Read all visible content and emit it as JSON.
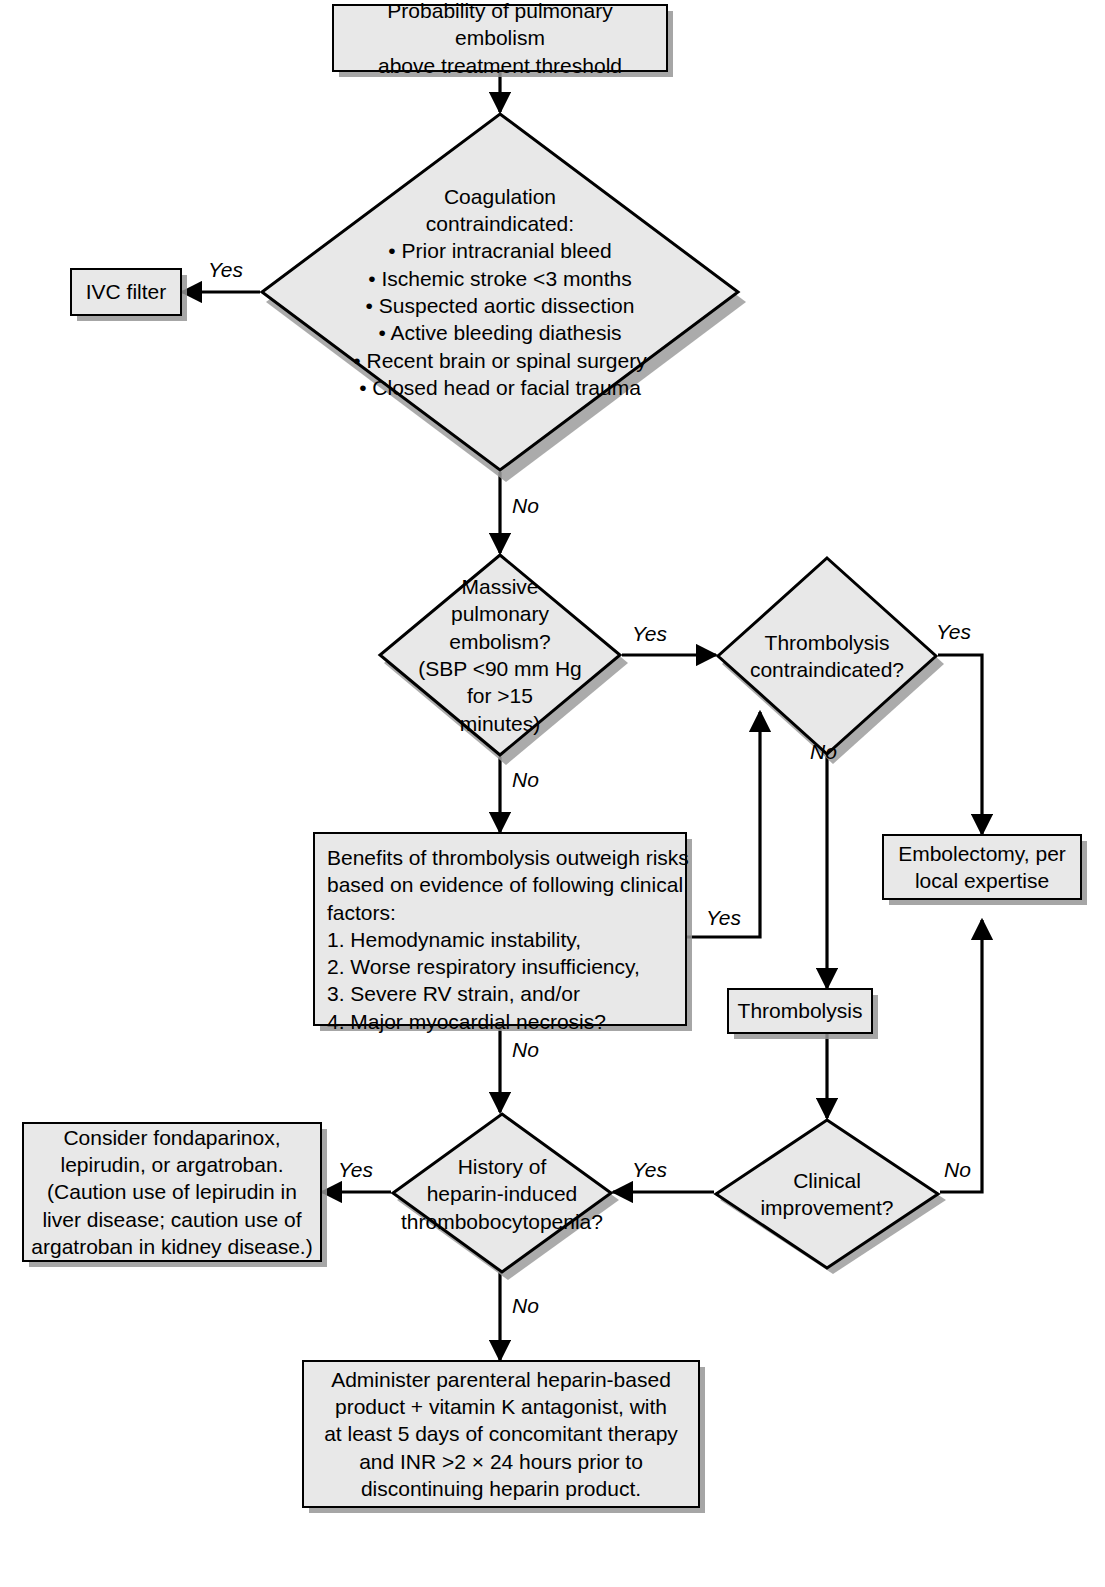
{
  "diagram": {
    "colors": {
      "node_fill": "#e8e8e8",
      "node_border": "#000000",
      "shadow": "#969696",
      "background": "#ffffff",
      "text": "#000000"
    }
  },
  "nodes": {
    "start": {
      "type": "process",
      "line1": "Probability of pulmonary embolism",
      "line2": "above treatment threshold"
    },
    "coagulation": {
      "type": "decision",
      "heading1": "Coagulation",
      "heading2": "contraindicated:",
      "bullets": [
        "• Prior intracranial bleed",
        "• Ischemic stroke <3 months",
        "• Suspected aortic dissection",
        "• Active bleeding diathesis",
        "• Recent brain or spinal surgery",
        "• Closed head or facial trauma"
      ]
    },
    "ivc_filter": {
      "type": "process",
      "label": "IVC filter"
    },
    "massive_pe": {
      "type": "decision",
      "lines": [
        "Massive",
        "pulmonary",
        "embolism?",
        "(SBP <90 mm Hg",
        "for >15",
        "minutes)"
      ]
    },
    "thrombolysis_contraindicated": {
      "type": "decision",
      "line1": "Thrombolysis",
      "line2": "contraindicated?"
    },
    "benefits": {
      "type": "process",
      "intro": [
        "Benefits of thrombolysis outweigh risks",
        "based on evidence of following clinical",
        "factors:"
      ],
      "items": [
        "1. Hemodynamic instability,",
        "2. Worse respiratory insufficiency,",
        "3. Severe RV strain, and/or",
        "4. Major myocardial necrosis?"
      ]
    },
    "embolectomy": {
      "type": "process",
      "line1": "Embolectomy, per",
      "line2": "local expertise"
    },
    "thrombolysis": {
      "type": "process",
      "label": "Thrombolysis"
    },
    "clinical_improvement": {
      "type": "decision",
      "line1": "Clinical",
      "line2": "improvement?"
    },
    "hit_history": {
      "type": "decision",
      "line1": "History of",
      "line2": "heparin-induced",
      "line3": "thrombobocytopenia?"
    },
    "alternative_anticoagulants": {
      "type": "process",
      "lines": [
        "Consider fondaparinox,",
        "lepirudin, or argatroban.",
        "(Caution use of lepirudin in",
        "liver disease; caution use of",
        "argatroban in kidney disease.)"
      ]
    },
    "heparin_regimen": {
      "type": "process",
      "lines": [
        "Administer parenteral heparin-based",
        "product + vitamin K antagonist, with",
        "at least 5 days of concomitant therapy",
        "and INR >2 × 24 hours prior to",
        "discontinuing heparin product."
      ]
    }
  },
  "edge_labels": {
    "coag_yes": "Yes",
    "coag_no": "No",
    "massive_pe_yes": "Yes",
    "massive_pe_no": "No",
    "thromb_contra_yes": "Yes",
    "thromb_contra_no": "No",
    "benefits_yes": "Yes",
    "benefits_no": "No",
    "clinical_no": "No",
    "clinical_yes": "Yes",
    "hit_yes": "Yes",
    "hit_no": "No"
  }
}
